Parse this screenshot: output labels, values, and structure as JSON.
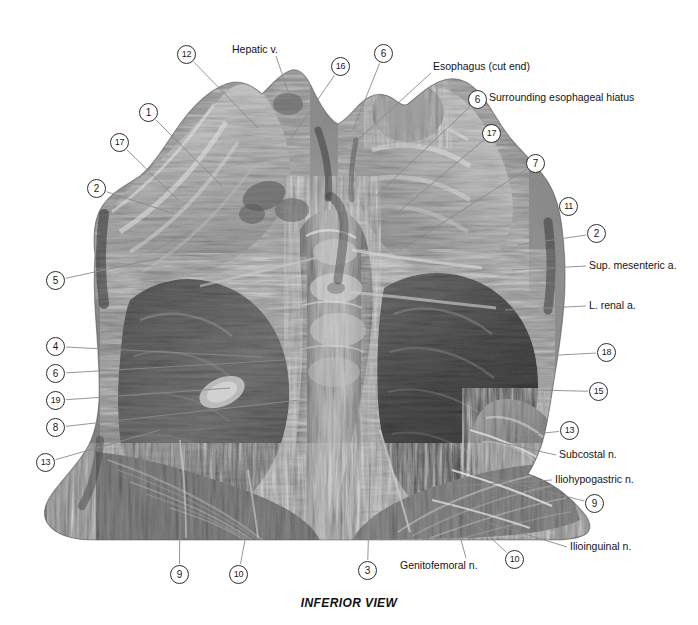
{
  "figure": {
    "caption": "INFERIOR VIEW",
    "view_type": "inferior-view-anatomical-photograph",
    "background_color": "#ffffff",
    "leader_line_color": "#8a8a8a",
    "circle_border_color": "#2e2e2e"
  },
  "numbered_callouts": [
    {
      "id": "c12",
      "number": "12",
      "x": 177,
      "y": 45,
      "tip_x": 258,
      "tip_y": 128
    },
    {
      "id": "c1",
      "number": "1",
      "x": 139,
      "y": 103,
      "tip_x": 222,
      "tip_y": 186
    },
    {
      "id": "c17l",
      "number": "17",
      "x": 110,
      "y": 133,
      "tip_x": 178,
      "tip_y": 200
    },
    {
      "id": "c2l",
      "number": "2",
      "x": 87,
      "y": 179,
      "tip_x": 175,
      "tip_y": 214
    },
    {
      "id": "c5",
      "number": "5",
      "x": 46,
      "y": 271,
      "tip_x": 160,
      "tip_y": 258
    },
    {
      "id": "c4",
      "number": "4",
      "x": 46,
      "y": 337,
      "tip_x": 262,
      "tip_y": 357
    },
    {
      "id": "c6l",
      "number": "6",
      "x": 46,
      "y": 364,
      "tip_x": 285,
      "tip_y": 360
    },
    {
      "id": "c19",
      "number": "19",
      "x": 46,
      "y": 391,
      "tip_x": 230,
      "tip_y": 388
    },
    {
      "id": "c8",
      "number": "8",
      "x": 46,
      "y": 418,
      "tip_x": 300,
      "tip_y": 400
    },
    {
      "id": "c13l",
      "number": "13",
      "x": 36,
      "y": 453,
      "tip_x": 160,
      "tip_y": 430
    },
    {
      "id": "c16",
      "number": "16",
      "x": 331,
      "y": 57,
      "tip_x": 290,
      "tip_y": 140
    },
    {
      "id": "c6t",
      "number": "6",
      "x": 374,
      "y": 44,
      "tip_x": 353,
      "tip_y": 130
    },
    {
      "id": "c6h",
      "number": "6",
      "x": 468,
      "y": 90,
      "tip_x": 376,
      "tip_y": 196
    },
    {
      "id": "c17r",
      "number": "17",
      "x": 482,
      "y": 124,
      "tip_x": 396,
      "tip_y": 214
    },
    {
      "id": "c7",
      "number": "7",
      "x": 526,
      "y": 154,
      "tip_x": 400,
      "tip_y": 250
    },
    {
      "id": "c11",
      "number": "11",
      "x": 559,
      "y": 197,
      "tip_x": 522,
      "tip_y": 214
    },
    {
      "id": "c2r",
      "number": "2",
      "x": 587,
      "y": 224,
      "tip_x": 518,
      "tip_y": 245
    },
    {
      "id": "c18",
      "number": "18",
      "x": 597,
      "y": 343,
      "tip_x": 540,
      "tip_y": 356
    },
    {
      "id": "c15",
      "number": "15",
      "x": 589,
      "y": 382,
      "tip_x": 536,
      "tip_y": 390
    },
    {
      "id": "c13r",
      "number": "13",
      "x": 560,
      "y": 421,
      "tip_x": 512,
      "tip_y": 436
    },
    {
      "id": "c9r",
      "number": "9",
      "x": 585,
      "y": 494,
      "tip_x": 460,
      "tip_y": 470
    },
    {
      "id": "c9b",
      "number": "9",
      "x": 170,
      "y": 565,
      "tip_x": 180,
      "tip_y": 473
    },
    {
      "id": "c10b",
      "number": "10",
      "x": 229,
      "y": 565,
      "tip_x": 252,
      "tip_y": 503
    },
    {
      "id": "c3",
      "number": "3",
      "x": 358,
      "y": 561,
      "tip_x": 370,
      "tip_y": 480
    },
    {
      "id": "c10br",
      "number": "10",
      "x": 505,
      "y": 550,
      "tip_x": 460,
      "tip_y": 510
    }
  ],
  "text_callouts": [
    {
      "id": "hepatic-v",
      "label": "Hepatic v.",
      "x": 232,
      "y": 44,
      "anchor": "left",
      "lx": 276,
      "ly": 56,
      "tip_x": 290,
      "tip_y": 97
    },
    {
      "id": "esophagus-cut",
      "label": "Esophagus (cut end)",
      "x": 433,
      "y": 61,
      "anchor": "left",
      "lx": 431,
      "ly": 73,
      "tip_x": 350,
      "tip_y": 147
    },
    {
      "id": "esoph-hiatus",
      "label": "Surrounding esophageal hiatus",
      "x": 489,
      "y": 92,
      "anchor": "left",
      "lx": 487,
      "ly": 99,
      "tip_x": 487,
      "tip_y": 99
    },
    {
      "id": "sup-mesenteric-a",
      "label": "Sup. mesenteric a.",
      "x": 589,
      "y": 260,
      "anchor": "left",
      "lx": 586,
      "ly": 266,
      "tip_x": 512,
      "tip_y": 270
    },
    {
      "id": "l-renal-a",
      "label": "L. renal a.",
      "x": 589,
      "y": 300,
      "anchor": "left",
      "lx": 586,
      "ly": 306,
      "tip_x": 505,
      "tip_y": 310
    },
    {
      "id": "subcostal-n",
      "label": "Subcostal n.",
      "x": 559,
      "y": 449,
      "anchor": "left",
      "lx": 556,
      "ly": 455,
      "tip_x": 490,
      "tip_y": 440
    },
    {
      "id": "iliohypogastric-n",
      "label": "Iliohypogastric n.",
      "x": 555,
      "y": 474,
      "anchor": "left",
      "lx": 552,
      "ly": 480,
      "tip_x": 456,
      "tip_y": 486
    },
    {
      "id": "ilioinguinal-n",
      "label": "Ilioinguinal n.",
      "x": 570,
      "y": 541,
      "anchor": "left",
      "lx": 567,
      "ly": 547,
      "tip_x": 480,
      "tip_y": 520
    },
    {
      "id": "genitofemoral-n",
      "label": "Genitofemoral n.",
      "x": 400,
      "y": 560,
      "anchor": "left",
      "lx": 466,
      "ly": 558,
      "tip_x": 450,
      "tip_y": 500
    }
  ]
}
